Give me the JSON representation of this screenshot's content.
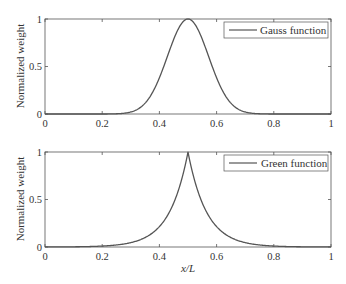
{
  "chart_data": [
    {
      "type": "line",
      "title": "",
      "xlabel": "",
      "ylabel": "Normalized weight",
      "xlim": [
        0,
        1
      ],
      "ylim": [
        0,
        1
      ],
      "xticks": [
        "0",
        "0.2",
        "0.4",
        "0.6",
        "0.8",
        "1"
      ],
      "yticks": [
        "0",
        "0.5",
        "1"
      ],
      "legend": {
        "position": "upper right",
        "entries": [
          "Gauss function"
        ]
      },
      "grid": false,
      "series": [
        {
          "name": "Gauss function",
          "color": "#555555",
          "x": [
            0,
            0.2,
            0.25,
            0.3,
            0.35,
            0.4,
            0.45,
            0.5,
            0.55,
            0.6,
            0.65,
            0.7,
            0.75,
            0.8,
            1
          ],
          "values": [
            0,
            0,
            0.004,
            0.03,
            0.11,
            0.37,
            0.78,
            1.0,
            0.78,
            0.37,
            0.11,
            0.03,
            0.004,
            0,
            0
          ]
        }
      ]
    },
    {
      "type": "line",
      "title": "",
      "xlabel": "x/L",
      "ylabel": "Normalized weight",
      "xlim": [
        0,
        1
      ],
      "ylim": [
        0,
        1
      ],
      "xticks": [
        "0",
        "0.2",
        "0.4",
        "0.6",
        "0.8",
        "1"
      ],
      "yticks": [
        "0",
        "0.5",
        "1"
      ],
      "legend": {
        "position": "upper right",
        "entries": [
          "Green function"
        ]
      },
      "grid": false,
      "series": [
        {
          "name": "Green function",
          "color": "#555555",
          "x": [
            0,
            0.1,
            0.2,
            0.3,
            0.35,
            0.4,
            0.45,
            0.48,
            0.5,
            0.52,
            0.55,
            0.6,
            0.65,
            0.7,
            0.8,
            0.9,
            1
          ],
          "values": [
            0.0,
            0.003,
            0.01,
            0.05,
            0.1,
            0.22,
            0.47,
            0.73,
            1.0,
            0.73,
            0.47,
            0.22,
            0.1,
            0.05,
            0.01,
            0.003,
            0.0
          ]
        }
      ]
    }
  ]
}
